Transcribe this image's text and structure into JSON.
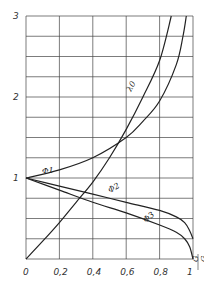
{
  "chart_data": {
    "type": "line",
    "title": "",
    "xlabel": "G/G",
    "ylabel": "",
    "xlim": [
      0,
      1
    ],
    "ylim": [
      0,
      3
    ],
    "grid": true,
    "x_ticks": [
      "0",
      "0,2",
      "0,4",
      "0,6",
      "0,8",
      "1"
    ],
    "y_ticks": [
      "0",
      "1",
      "2",
      "3"
    ],
    "grid_x_step": 0.2,
    "grid_y_step": 0.25,
    "series": [
      {
        "name": "λ0",
        "x": [
          0,
          0.1,
          0.2,
          0.3,
          0.4,
          0.5,
          0.6,
          0.7,
          0.8,
          0.87
        ],
        "y": [
          0,
          0.22,
          0.45,
          0.7,
          0.95,
          1.25,
          1.6,
          2.0,
          2.45,
          3.0
        ]
      },
      {
        "name": "Φ1",
        "x": [
          0,
          0.2,
          0.4,
          0.6,
          0.7,
          0.8,
          0.9,
          0.94,
          0.96
        ],
        "y": [
          1,
          1.1,
          1.25,
          1.5,
          1.7,
          1.95,
          2.4,
          2.75,
          3.0
        ]
      },
      {
        "name": "Φ2",
        "x": [
          0,
          0.2,
          0.4,
          0.6,
          0.8,
          0.9,
          0.95,
          0.98,
          1.0
        ],
        "y": [
          1,
          0.9,
          0.8,
          0.7,
          0.6,
          0.52,
          0.45,
          0.35,
          0.25
        ]
      },
      {
        "name": "Φ3",
        "x": [
          0,
          0.2,
          0.4,
          0.6,
          0.8,
          0.9,
          0.95,
          0.98,
          1.0
        ],
        "y": [
          1,
          0.85,
          0.7,
          0.57,
          0.42,
          0.33,
          0.25,
          0.15,
          0.0
        ]
      }
    ]
  },
  "labels": {
    "lambda0": "λ0",
    "phi1": "Φ1",
    "phi2": "Φ2",
    "phi3": "Φ3",
    "xlabel_num": "G",
    "xlabel_den": "G"
  }
}
